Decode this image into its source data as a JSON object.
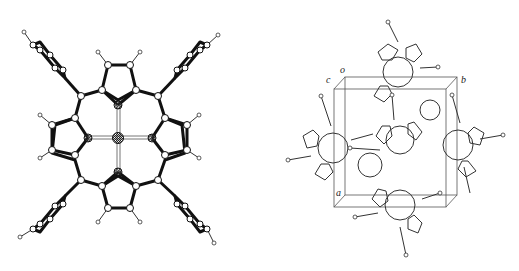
{
  "figure": {
    "left_panel": {
      "title": "",
      "description": "Molecular structure of metallo-tetraphenylporphyrin (central metal atom coordinated by four pyrrole nitrogens, four phenyl rings at meso positions)"
    },
    "right_panel": {
      "title": "",
      "description": "Crystal packing diagram with unit cell",
      "axis_labels": {
        "origin": "o",
        "a": "a",
        "b": "b",
        "c": "c"
      }
    }
  },
  "colors": {
    "bond": "#111111",
    "atom_fill": "#ffffff",
    "cell_edge": "#555555",
    "background": "#ffffff"
  }
}
